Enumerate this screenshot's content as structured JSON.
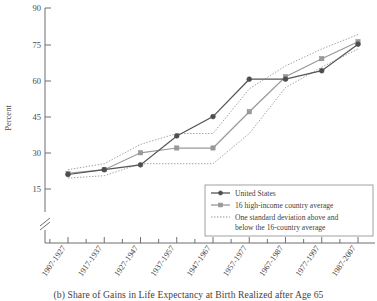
{
  "caption": "(b) Share of Gains in Life Expectancy at Birth Realized after Age 65",
  "axis": {
    "ylabel": "Percent",
    "y_ticks": [
      "15",
      "30",
      "45",
      "60",
      "75",
      "90"
    ],
    "axis_break": "axis-break-marker"
  },
  "legend": {
    "items": [
      {
        "label": "United States",
        "style": "solid-circle-dark",
        "color": "#555555"
      },
      {
        "label": "16 high-income country average",
        "style": "solid-square-gray",
        "color": "#9a9a9a"
      },
      {
        "label": "One standard deviation above and",
        "style": "dotted",
        "color": "#8f8f8f"
      },
      {
        "label": "below the 16-country average",
        "style": "dotted-cont",
        "color": "#8f8f8f"
      }
    ]
  },
  "chart_data": {
    "type": "line",
    "title": "(b) Share of Gains in Life Expectancy at Birth Realized after Age 65",
    "xlabel": "",
    "ylabel": "Percent",
    "ylim": [
      13,
      90
    ],
    "yticks": [
      15,
      30,
      45,
      60,
      75,
      90
    ],
    "grid": false,
    "legend_position": "bottom-right",
    "axis_break_below": 15,
    "categories": [
      "1907-1927",
      "1917-1937",
      "1927-1947",
      "1937-1957",
      "1947-1967",
      "1957-1977",
      "1967-1987",
      "1977-1997",
      "1987-2007"
    ],
    "series": [
      {
        "name": "United States",
        "marker": "circle",
        "color": "#555555",
        "values": [
          21,
          23,
          25,
          37,
          45,
          60.5,
          60.5,
          64,
          75
        ]
      },
      {
        "name": "16 high-income country average",
        "marker": "square",
        "color": "#9a9a9a",
        "values": [
          21.5,
          23,
          30,
          32,
          32,
          47,
          61.5,
          69,
          76
        ]
      },
      {
        "name": "One standard deviation above the 16-country average",
        "marker": "none",
        "style": "dotted",
        "color": "#8f8f8f",
        "values": [
          23,
          25.5,
          33.5,
          38,
          38,
          56.5,
          66,
          73,
          79
        ]
      },
      {
        "name": "One standard deviation below the 16-country average",
        "marker": "none",
        "style": "dotted",
        "color": "#8f8f8f",
        "values": [
          19.5,
          20.5,
          25.5,
          25.5,
          25.5,
          38,
          57,
          65.5,
          73
        ]
      }
    ]
  }
}
